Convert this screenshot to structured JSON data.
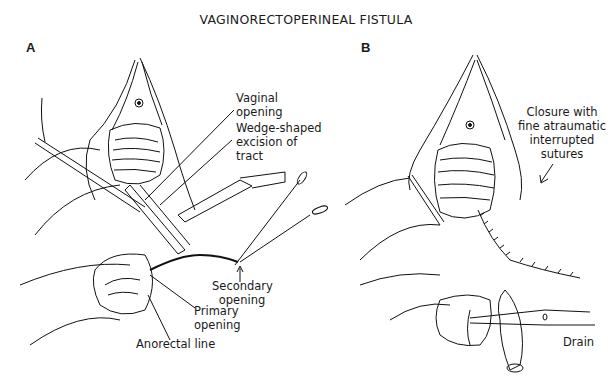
{
  "figure": {
    "title": "VAGINORECTOPERINEAL FISTULA",
    "panels": [
      {
        "id": "A",
        "letter": "A",
        "labels": {
          "vaginal_opening": [
            "Vaginal",
            "opening"
          ],
          "wedge_excision": [
            "Wedge-shaped",
            "excision of",
            "tract"
          ],
          "secondary_opening": [
            "Secondary",
            "opening"
          ],
          "primary_opening": [
            "Primary",
            "opening"
          ],
          "anorectal_line": [
            "Anorectal line"
          ]
        }
      },
      {
        "id": "B",
        "letter": "B",
        "labels": {
          "closure": [
            "Closure with",
            "fine atraumatic",
            "interrupted",
            "sutures"
          ],
          "drain": [
            "Drain"
          ]
        }
      }
    ],
    "colors": {
      "ink": "#111111",
      "background": "#ffffff"
    }
  }
}
